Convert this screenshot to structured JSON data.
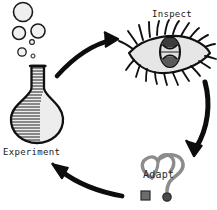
{
  "diagram": {
    "background_color": "#ffffff",
    "ink_color": "#111111",
    "fill_color": "#e9e9e9",
    "shade_color": "#cccccc",
    "direction": "clockwise"
  },
  "nodes": {
    "experiment": {
      "label": "Experiment",
      "icon": "flask-icon",
      "bubbles_count": 6
    },
    "inspect": {
      "label": "Inspect",
      "icon": "eye-icon"
    },
    "adapt": {
      "label": "Adapt",
      "icon": "heart-question-mark-icon"
    }
  },
  "arrows": [
    {
      "name": "arrow-experiment-to-inspect",
      "from": "experiment",
      "to": "inspect"
    },
    {
      "name": "arrow-inspect-to-adapt",
      "from": "inspect",
      "to": "adapt"
    },
    {
      "name": "arrow-adapt-to-experiment",
      "from": "adapt",
      "to": "experiment"
    }
  ]
}
